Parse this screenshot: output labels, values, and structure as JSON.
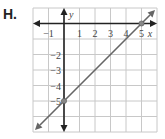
{
  "problem": {
    "label": "H."
  },
  "chart_data": {
    "type": "line",
    "title": "",
    "xlabel": "x",
    "ylabel": "y",
    "xlim": [
      -2,
      6
    ],
    "ylim": [
      -7,
      1
    ],
    "grid": true,
    "x_tick_labels": [
      "−1",
      "1",
      "2",
      "3",
      "4",
      "5"
    ],
    "y_tick_labels": [
      "−2",
      "−3",
      "−4",
      "−5"
    ],
    "series": [
      {
        "name": "line",
        "equation": "y = x - 5",
        "points": [
          {
            "x": 0,
            "y": -5
          },
          {
            "x": 5,
            "y": 0
          }
        ],
        "marked_points": [
          {
            "x": 0,
            "y": -5
          },
          {
            "x": 5,
            "y": 0
          }
        ],
        "color": "#666666"
      }
    ]
  }
}
